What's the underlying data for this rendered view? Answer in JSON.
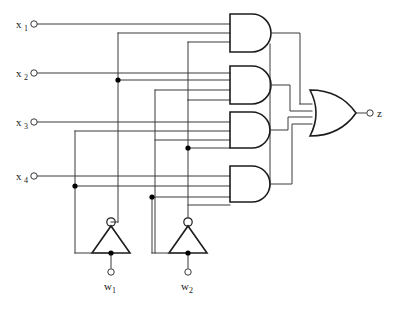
{
  "diagram": {
    "type": "logic-circuit-schematic",
    "background_color": "#ffffff",
    "wire_color": "#3a3a3a",
    "gate_color": "#1c1c1c"
  },
  "inputs": [
    {
      "id": "x1",
      "base": "x",
      "sub": "1",
      "terminal_x": 34,
      "terminal_y": 24,
      "wire_y": 24
    },
    {
      "id": "x2",
      "base": "x",
      "sub": "2",
      "terminal_x": 34,
      "terminal_y": 73,
      "wire_y": 73
    },
    {
      "id": "x3",
      "base": "x",
      "sub": "3",
      "terminal_x": 34,
      "terminal_y": 122,
      "wire_y": 122
    },
    {
      "id": "x4",
      "base": "x",
      "sub": "4",
      "terminal_x": 34,
      "terminal_y": 176,
      "wire_y": 176
    }
  ],
  "outputs": [
    {
      "id": "z",
      "base": "z",
      "sub": "",
      "terminal_x": 370,
      "terminal_y": 113
    },
    {
      "id": "w1",
      "base": "w",
      "sub": "1",
      "terminal_x": 111,
      "terminal_y": 272
    },
    {
      "id": "w2",
      "base": "w",
      "sub": "2",
      "terminal_x": 188,
      "terminal_y": 272
    }
  ],
  "and_gates": [
    {
      "id": "and1",
      "label": "AND",
      "inputs": 3,
      "x": 230,
      "y": 14,
      "w": 44,
      "h": 38
    },
    {
      "id": "and2",
      "label": "AND",
      "inputs": 3,
      "x": 230,
      "y": 66,
      "w": 44,
      "h": 38
    },
    {
      "id": "and3",
      "label": "AND",
      "inputs": 3,
      "x": 230,
      "y": 112,
      "w": 44,
      "h": 36
    },
    {
      "id": "and4",
      "label": "AND",
      "inputs": 3,
      "x": 230,
      "y": 166,
      "w": 44,
      "h": 36
    }
  ],
  "or_gates": [
    {
      "id": "or1",
      "label": "OR",
      "inputs": 4,
      "x": 312,
      "y": 90,
      "w": 44,
      "h": 46
    }
  ],
  "inverters": [
    {
      "id": "inv1",
      "label": "NOT",
      "cx": 111,
      "apex_y": 222,
      "base_y": 253,
      "half_width": 19
    },
    {
      "id": "inv2",
      "label": "NOT",
      "cx": 188,
      "apex_y": 222,
      "base_y": 253,
      "half_width": 19
    }
  ],
  "junctions": [
    {
      "id": "j-x2-v118",
      "x": 118,
      "y": 80
    },
    {
      "id": "j-x3-v188",
      "x": 188,
      "y": 148
    },
    {
      "id": "j-x4-v75",
      "x": 75,
      "y": 186
    },
    {
      "id": "j-x4-v152",
      "x": 152,
      "y": 197
    },
    {
      "id": "j-inv1-out",
      "x": 111,
      "y": 253
    },
    {
      "id": "j-inv2-out",
      "x": 188,
      "y": 253
    }
  ]
}
